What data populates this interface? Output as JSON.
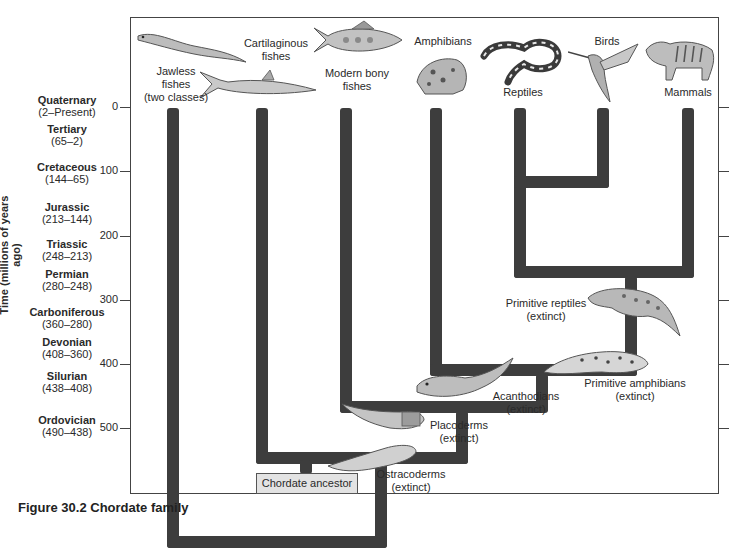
{
  "diagram": {
    "type": "phylogenetic-tree",
    "y_axis": {
      "label": "Time (millions of years ago)",
      "ticks": [
        "0",
        "100",
        "200",
        "300",
        "400",
        "500"
      ]
    },
    "eras": [
      {
        "name": "Quaternary",
        "range": "(2–Present)"
      },
      {
        "name": "Tertiary",
        "range": "(65–2)"
      },
      {
        "name": "Cretaceous",
        "range": "(144–65)"
      },
      {
        "name": "Jurassic",
        "range": "(213–144)"
      },
      {
        "name": "Triassic",
        "range": "(248–213)"
      },
      {
        "name": "Permian",
        "range": "(280–248)"
      },
      {
        "name": "Carboniferous",
        "range": "(360–280)"
      },
      {
        "name": "Devonian",
        "range": "(408–360)"
      },
      {
        "name": "Silurian",
        "range": "(438–408)"
      },
      {
        "name": "Ordovician",
        "range": "(490–438)"
      }
    ],
    "living_groups": [
      {
        "line1": "Jawless",
        "line2": "fishes",
        "line3": "(two classes)"
      },
      {
        "line1": "Cartilaginous",
        "line2": "fishes"
      },
      {
        "line1": "Modern bony",
        "line2": "fishes"
      },
      {
        "line1": "Amphibians"
      },
      {
        "line1": "Reptiles"
      },
      {
        "line1": "Birds"
      },
      {
        "line1": "Mammals"
      }
    ],
    "extinct_groups": [
      {
        "line1": "Primitive reptiles",
        "line2": "(extinct)"
      },
      {
        "line1": "Primitive amphibians",
        "line2": "(extinct)"
      },
      {
        "line1": "Acanthodians",
        "line2": "(extinct)"
      },
      {
        "line1": "Placoderms",
        "line2": "(extinct)"
      },
      {
        "line1": "Ostracoderms",
        "line2": "(extinct)"
      }
    ],
    "root": "Chordate ancestor",
    "caption": "Figure 30.2  Chordate family"
  }
}
